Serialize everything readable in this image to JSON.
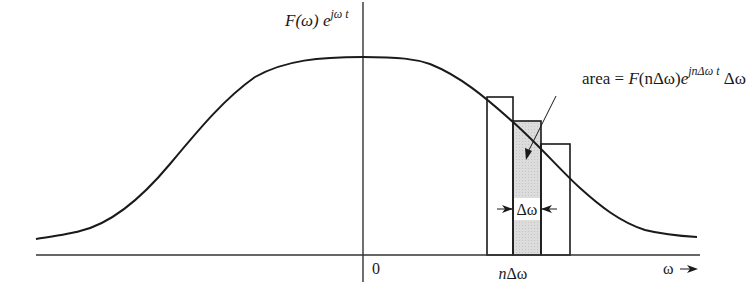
{
  "diagram": {
    "y_label": {
      "base": "F(ω) e",
      "superscript": "jω t"
    },
    "area_label": {
      "prefix": "area = ",
      "func": "F",
      "arg": "(nΔω)",
      "exp_base": "e",
      "superscript": "jnΔω t",
      "suffix": " Δω"
    },
    "origin_label": "0",
    "n_delta_omega_label": {
      "n": "n",
      "rest": "Δω"
    },
    "delta_omega_label": "Δω",
    "x_axis_label": "ω",
    "x_axis_arrow": "→",
    "colors": {
      "line": "#1a1a1a",
      "axis": "#333333",
      "shaded_strip": "#d9d9d9",
      "background": "#ffffff"
    },
    "strips": [
      {
        "name": "strip-left",
        "shaded": false
      },
      {
        "name": "strip-center-n",
        "shaded": true
      },
      {
        "name": "strip-right",
        "shaded": false
      }
    ]
  }
}
